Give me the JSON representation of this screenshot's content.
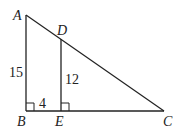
{
  "diagram": {
    "type": "geometry",
    "points": {
      "A": {
        "label": "A",
        "x": 26,
        "y": 15
      },
      "B": {
        "label": "B",
        "x": 26,
        "y": 111
      },
      "C": {
        "label": "C",
        "x": 164,
        "y": 111
      },
      "D": {
        "label": "D",
        "x": 61,
        "y": 39
      },
      "E": {
        "label": "E",
        "x": 61,
        "y": 111
      }
    },
    "segments": [
      "AB",
      "BC",
      "AC",
      "DE"
    ],
    "right_angles": [
      "B",
      "E"
    ],
    "measures": {
      "AB": "15",
      "DE": "12",
      "BE": "4"
    },
    "line_color": "#222222"
  }
}
